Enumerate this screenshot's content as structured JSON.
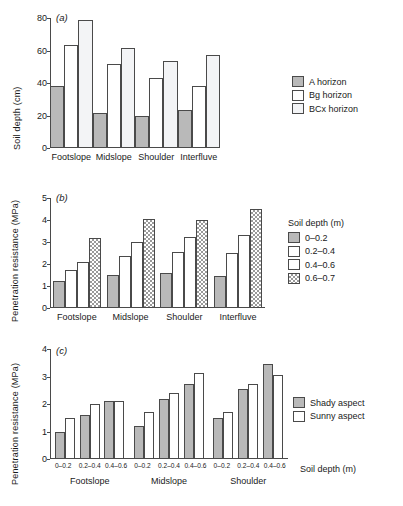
{
  "figure": {
    "panels": [
      "a",
      "b",
      "c"
    ]
  },
  "panel_a": {
    "tag": "(a)",
    "ylabel": "Soil depth (cm)",
    "yticks": [
      "0",
      "20",
      "40",
      "60",
      "80"
    ],
    "categories": [
      "Footslope",
      "Midslope",
      "Shoulder",
      "Interfluve"
    ],
    "legend": {
      "title": "",
      "items": [
        {
          "label": "A horizon",
          "fill": "#b9b9b9"
        },
        {
          "label": "Bg horizon",
          "fill": "#ffffff"
        },
        {
          "label": "BCx horizon",
          "fill": "#f3f4f6"
        }
      ]
    }
  },
  "panel_b": {
    "tag": "(b)",
    "ylabel": "Penetration resistance (MPa)",
    "yticks": [
      "0",
      "1",
      "2",
      "3",
      "4",
      "5"
    ],
    "categories": [
      "Footslope",
      "Midslope",
      "Shoulder",
      "Interfluve"
    ],
    "legend": {
      "title": "Soil depth (m)",
      "items": [
        {
          "label": "0–0.2",
          "fill": "#b9b9b9"
        },
        {
          "label": "0.2–0.4",
          "fill": "#ffffff"
        },
        {
          "label": "0.4–0.6",
          "fill": "#ffffff"
        },
        {
          "label": "0.6–0.7",
          "fill": "checker"
        }
      ]
    }
  },
  "panel_c": {
    "tag": "(c)",
    "ylabel": "Penetration resistance (MPa)",
    "yticks": [
      "0",
      "1",
      "2",
      "3",
      "4"
    ],
    "categories": [
      "Footslope",
      "Midslope",
      "Shoulder"
    ],
    "depth_ticks": [
      "0–0.2",
      "0.2–0.4",
      "0.4–0.6"
    ],
    "xaxis_title": "Soil depth (m)",
    "legend": {
      "title": "",
      "items": [
        {
          "label": "Shady aspect",
          "fill": "#b9b9b9"
        },
        {
          "label": "Sunny aspect",
          "fill": "#ffffff"
        }
      ]
    }
  },
  "chart_data": [
    {
      "type": "bar",
      "panel": "a",
      "title": "",
      "xlabel": "",
      "ylabel": "Soil depth (cm)",
      "ylim": [
        0,
        80
      ],
      "yticks": [
        0,
        20,
        40,
        60,
        80
      ],
      "grid": false,
      "legend_position": "right",
      "categories": [
        "Footslope",
        "Midslope",
        "Shoulder",
        "Interfluve"
      ],
      "series": [
        {
          "name": "A horizon",
          "values": [
            38.0,
            21.5,
            20.0,
            23.5
          ]
        },
        {
          "name": "Bg horizon",
          "values": [
            63.5,
            51.5,
            43.0,
            38.0
          ]
        },
        {
          "name": "BCx horizon",
          "values": [
            79.0,
            61.5,
            53.5,
            57.5
          ]
        }
      ]
    },
    {
      "type": "bar",
      "panel": "b",
      "title": "",
      "xlabel": "",
      "ylabel": "Penetration resistance (MPa)",
      "ylim": [
        0,
        5
      ],
      "yticks": [
        0,
        1,
        2,
        3,
        4,
        5
      ],
      "grid": false,
      "legend_position": "right",
      "legend_title": "Soil depth (m)",
      "categories": [
        "Footslope",
        "Midslope",
        "Shoulder",
        "Interfluve"
      ],
      "series": [
        {
          "name": "0–0.2",
          "values": [
            1.22,
            1.48,
            1.58,
            1.47
          ]
        },
        {
          "name": "0.2–0.4",
          "values": [
            1.75,
            2.35,
            2.55,
            2.52
          ]
        },
        {
          "name": "0.4–0.6",
          "values": [
            2.1,
            3.0,
            3.23,
            3.33
          ]
        },
        {
          "name": "0.6–0.7",
          "values": [
            3.2,
            4.03,
            4.0,
            4.5
          ]
        }
      ]
    },
    {
      "type": "bar",
      "panel": "c",
      "title": "",
      "xlabel": "Soil depth (m)",
      "ylabel": "Penetration resistance (MPa)",
      "ylim": [
        0,
        4
      ],
      "yticks": [
        0,
        1,
        2,
        3,
        4
      ],
      "grid": false,
      "legend_position": "right",
      "categories": [
        "Footslope",
        "Midslope",
        "Shoulder"
      ],
      "subcategories": [
        "0–0.2",
        "0.2–0.4",
        "0.4–0.6"
      ],
      "series": [
        {
          "name": "Shady aspect",
          "values": [
            [
              1.0,
              1.6,
              2.1
            ],
            [
              1.2,
              2.2,
              2.73
            ],
            [
              1.5,
              2.54,
              3.45
            ]
          ]
        },
        {
          "name": "Sunny aspect",
          "values": [
            [
              1.5,
              2.0,
              2.1
            ],
            [
              1.7,
              2.41,
              3.12
            ],
            [
              1.7,
              2.72,
              3.04
            ]
          ]
        }
      ]
    }
  ]
}
